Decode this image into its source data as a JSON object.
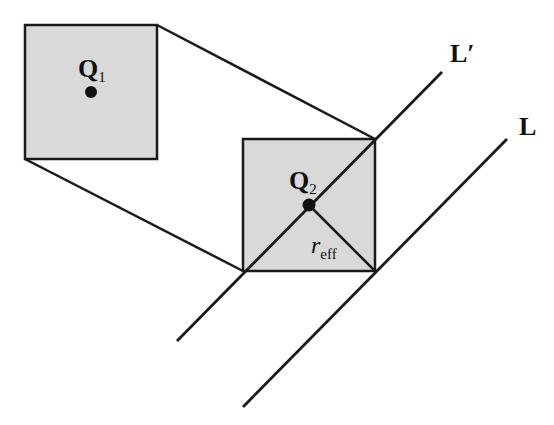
{
  "diagram": {
    "colors": {
      "background": "#ffffff",
      "square_fill": "#d9d9d9",
      "stroke": "#1a1a1a",
      "text": "#111111"
    },
    "labels": {
      "q1": "Q",
      "q1_sub": "1",
      "q2": "Q",
      "q2_sub": "2",
      "r": "r",
      "r_sub": "eff",
      "l_prime": "L′",
      "l": "L"
    },
    "shapes": {
      "square1": {
        "x": 25,
        "y": 25,
        "w": 132,
        "h": 134
      },
      "square2": {
        "x": 243,
        "y": 139,
        "w": 132,
        "h": 132
      },
      "q1_point": {
        "x": 91,
        "y": 92
      },
      "q2_point": {
        "x": 309,
        "y": 205
      },
      "line_l_prime": {
        "x1": 177,
        "y1": 341,
        "x2": 442,
        "y2": 72
      },
      "line_l": {
        "x1": 243,
        "y1": 407,
        "x2": 507,
        "y2": 139
      }
    }
  }
}
